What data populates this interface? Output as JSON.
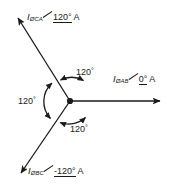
{
  "diagram": {
    "type": "phasor-diagram",
    "stroke_color": "#1a1a1a",
    "background": "#ffffff",
    "origin": {
      "x": 70,
      "y": 101
    },
    "phasors": [
      {
        "id": "phase-ca",
        "symbol": "I",
        "subscript": "ØCA",
        "angle_text": "120°",
        "unit": "A",
        "direction_deg": 135,
        "tip": {
          "x": 16,
          "y": 16
        },
        "label": "IØCA ∠120° A"
      },
      {
        "id": "phase-ab",
        "symbol": "I",
        "subscript": "ØAB",
        "angle_text": "0°",
        "unit": "A",
        "direction_deg": 0,
        "tip": {
          "x": 166,
          "y": 101
        },
        "label": "IØAB ∠0° A"
      },
      {
        "id": "phase-bc",
        "symbol": "I",
        "subscript": "ØBC",
        "angle_text": "-120°",
        "unit": "A",
        "direction_deg": 225,
        "tip": {
          "x": 18,
          "y": 176
        },
        "label": "IØBC ∠-120° A"
      }
    ],
    "angle_marks": [
      {
        "id": "angle-top",
        "value": "120",
        "degree_symbol": "°"
      },
      {
        "id": "angle-left",
        "value": "120",
        "degree_symbol": "°"
      },
      {
        "id": "angle-bottom",
        "value": "120",
        "degree_symbol": "°"
      }
    ]
  }
}
